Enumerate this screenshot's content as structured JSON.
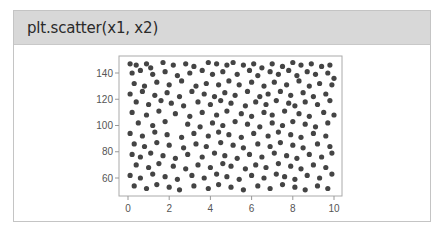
{
  "header": {
    "title": "plt.scatter(x1, x2)"
  },
  "colors": {
    "header_bg": "#d8d8d8",
    "marker": "#444444",
    "frame": "#aaaaaa",
    "card_border": "#c4c4c4"
  },
  "chart_data": {
    "type": "scatter",
    "title": "plt.scatter(x1, x2)",
    "xlabel": "",
    "ylabel": "",
    "xlim": [
      -0.5,
      10.4
    ],
    "ylim": [
      46,
      153
    ],
    "xticks": [
      0,
      2,
      4,
      6,
      8,
      10
    ],
    "yticks": [
      60,
      80,
      100,
      120,
      140
    ],
    "grid": false,
    "legend": null,
    "series": [
      {
        "name": "x1 vs x2",
        "marker_color": "#444444",
        "points": [
          [
            0.1,
            147
          ],
          [
            0.4,
            146
          ],
          [
            0.9,
            147
          ],
          [
            1.1,
            144
          ],
          [
            1.7,
            148
          ],
          [
            2.2,
            146
          ],
          [
            2.8,
            147
          ],
          [
            3.2,
            145
          ],
          [
            3.9,
            148
          ],
          [
            4.3,
            147
          ],
          [
            4.8,
            146
          ],
          [
            5.1,
            148
          ],
          [
            5.6,
            146
          ],
          [
            6.1,
            147
          ],
          [
            6.5,
            144
          ],
          [
            7.0,
            147
          ],
          [
            7.5,
            145
          ],
          [
            8.0,
            148
          ],
          [
            8.4,
            146
          ],
          [
            8.9,
            147
          ],
          [
            9.4,
            145
          ],
          [
            9.8,
            146
          ],
          [
            0.2,
            140
          ],
          [
            0.6,
            142
          ],
          [
            1.2,
            139
          ],
          [
            1.8,
            141
          ],
          [
            2.4,
            138
          ],
          [
            3.0,
            140
          ],
          [
            3.6,
            142
          ],
          [
            4.1,
            139
          ],
          [
            4.6,
            141
          ],
          [
            5.3,
            139
          ],
          [
            5.9,
            142
          ],
          [
            6.3,
            138
          ],
          [
            6.9,
            141
          ],
          [
            7.3,
            139
          ],
          [
            7.8,
            142
          ],
          [
            8.2,
            138
          ],
          [
            8.7,
            141
          ],
          [
            9.1,
            139
          ],
          [
            9.7,
            140
          ],
          [
            10.0,
            136
          ],
          [
            0.3,
            132
          ],
          [
            0.8,
            130
          ],
          [
            1.4,
            133
          ],
          [
            2.0,
            131
          ],
          [
            2.6,
            134
          ],
          [
            3.3,
            130
          ],
          [
            3.8,
            132
          ],
          [
            4.4,
            131
          ],
          [
            4.9,
            134
          ],
          [
            5.4,
            131
          ],
          [
            6.0,
            133
          ],
          [
            6.6,
            130
          ],
          [
            7.1,
            133
          ],
          [
            7.7,
            131
          ],
          [
            8.3,
            134
          ],
          [
            8.8,
            130
          ],
          [
            9.3,
            132
          ],
          [
            9.9,
            131
          ],
          [
            0.1,
            124
          ],
          [
            0.7,
            126
          ],
          [
            1.3,
            123
          ],
          [
            1.9,
            125
          ],
          [
            2.5,
            122
          ],
          [
            3.1,
            126
          ],
          [
            3.7,
            124
          ],
          [
            4.2,
            122
          ],
          [
            4.7,
            125
          ],
          [
            5.2,
            123
          ],
          [
            5.8,
            126
          ],
          [
            6.4,
            122
          ],
          [
            6.8,
            124
          ],
          [
            7.4,
            126
          ],
          [
            7.9,
            123
          ],
          [
            8.5,
            125
          ],
          [
            9.0,
            122
          ],
          [
            9.6,
            124
          ],
          [
            0.4,
            118
          ],
          [
            1.0,
            116
          ],
          [
            1.6,
            119
          ],
          [
            2.1,
            117
          ],
          [
            2.7,
            115
          ],
          [
            3.4,
            118
          ],
          [
            4.0,
            116
          ],
          [
            4.5,
            119
          ],
          [
            5.0,
            117
          ],
          [
            5.7,
            115
          ],
          [
            6.2,
            118
          ],
          [
            6.7,
            116
          ],
          [
            7.2,
            119
          ],
          [
            7.8,
            117
          ],
          [
            8.1,
            115
          ],
          [
            8.6,
            118
          ],
          [
            9.2,
            116
          ],
          [
            9.8,
            119
          ],
          [
            0.2,
            110
          ],
          [
            0.9,
            108
          ],
          [
            1.5,
            111
          ],
          [
            2.3,
            109
          ],
          [
            3.0,
            107
          ],
          [
            3.6,
            110
          ],
          [
            4.3,
            108
          ],
          [
            4.8,
            111
          ],
          [
            5.5,
            109
          ],
          [
            6.0,
            107
          ],
          [
            6.6,
            110
          ],
          [
            7.0,
            108
          ],
          [
            7.6,
            111
          ],
          [
            8.3,
            109
          ],
          [
            8.8,
            107
          ],
          [
            9.5,
            110
          ],
          [
            10.0,
            108
          ],
          [
            0.5,
            102
          ],
          [
            1.2,
            100
          ],
          [
            1.8,
            103
          ],
          [
            2.9,
            101
          ],
          [
            3.5,
            99
          ],
          [
            4.1,
            102
          ],
          [
            4.6,
            100
          ],
          [
            5.2,
            103
          ],
          [
            5.8,
            101
          ],
          [
            6.4,
            99
          ],
          [
            7.0,
            102
          ],
          [
            7.5,
            100
          ],
          [
            8.0,
            103
          ],
          [
            8.6,
            101
          ],
          [
            9.1,
            99
          ],
          [
            9.7,
            102
          ],
          [
            0.1,
            94
          ],
          [
            0.7,
            92
          ],
          [
            1.3,
            95
          ],
          [
            1.9,
            93
          ],
          [
            2.6,
            91
          ],
          [
            3.2,
            94
          ],
          [
            3.9,
            92
          ],
          [
            4.4,
            95
          ],
          [
            4.9,
            93
          ],
          [
            5.5,
            91
          ],
          [
            6.1,
            94
          ],
          [
            6.8,
            92
          ],
          [
            7.3,
            95
          ],
          [
            7.9,
            93
          ],
          [
            8.4,
            91
          ],
          [
            9.0,
            94
          ],
          [
            9.6,
            92
          ],
          [
            0.3,
            86
          ],
          [
            0.8,
            84
          ],
          [
            1.4,
            87
          ],
          [
            2.0,
            85
          ],
          [
            2.7,
            83
          ],
          [
            3.3,
            86
          ],
          [
            3.8,
            84
          ],
          [
            4.5,
            87
          ],
          [
            5.1,
            85
          ],
          [
            5.6,
            83
          ],
          [
            6.3,
            86
          ],
          [
            6.9,
            84
          ],
          [
            7.4,
            87
          ],
          [
            8.0,
            85
          ],
          [
            8.5,
            83
          ],
          [
            9.2,
            86
          ],
          [
            9.8,
            84
          ],
          [
            0.2,
            78
          ],
          [
            0.6,
            76
          ],
          [
            1.1,
            79
          ],
          [
            1.7,
            77
          ],
          [
            2.3,
            75
          ],
          [
            2.9,
            78
          ],
          [
            3.6,
            76
          ],
          [
            4.2,
            79
          ],
          [
            4.7,
            77
          ],
          [
            5.3,
            75
          ],
          [
            5.9,
            78
          ],
          [
            6.5,
            76
          ],
          [
            7.1,
            79
          ],
          [
            7.7,
            77
          ],
          [
            8.2,
            75
          ],
          [
            8.8,
            78
          ],
          [
            9.4,
            76
          ],
          [
            9.9,
            79
          ],
          [
            0.4,
            70
          ],
          [
            1.0,
            68
          ],
          [
            1.5,
            71
          ],
          [
            2.2,
            69
          ],
          [
            2.8,
            67
          ],
          [
            3.4,
            70
          ],
          [
            4.0,
            68
          ],
          [
            4.6,
            71
          ],
          [
            5.0,
            69
          ],
          [
            5.7,
            67
          ],
          [
            6.2,
            70
          ],
          [
            6.7,
            68
          ],
          [
            7.3,
            71
          ],
          [
            7.9,
            69
          ],
          [
            8.4,
            67
          ],
          [
            9.0,
            70
          ],
          [
            9.6,
            68
          ],
          [
            0.1,
            62
          ],
          [
            0.6,
            60
          ],
          [
            1.2,
            63
          ],
          [
            1.8,
            61
          ],
          [
            2.4,
            59
          ],
          [
            3.1,
            62
          ],
          [
            3.7,
            60
          ],
          [
            4.3,
            63
          ],
          [
            4.8,
            61
          ],
          [
            5.4,
            59
          ],
          [
            6.0,
            62
          ],
          [
            6.6,
            60
          ],
          [
            7.2,
            63
          ],
          [
            7.6,
            61
          ],
          [
            8.1,
            59
          ],
          [
            8.7,
            62
          ],
          [
            9.3,
            60
          ],
          [
            9.9,
            63
          ],
          [
            0.3,
            54
          ],
          [
            0.9,
            52
          ],
          [
            1.4,
            55
          ],
          [
            2.0,
            53
          ],
          [
            2.5,
            51
          ],
          [
            3.2,
            54
          ],
          [
            3.9,
            52
          ],
          [
            4.4,
            55
          ],
          [
            5.0,
            53
          ],
          [
            5.6,
            51
          ],
          [
            6.3,
            54
          ],
          [
            6.9,
            52
          ],
          [
            7.5,
            55
          ],
          [
            8.1,
            53
          ],
          [
            8.6,
            51
          ],
          [
            9.2,
            54
          ],
          [
            9.7,
            52
          ]
        ]
      }
    ]
  }
}
